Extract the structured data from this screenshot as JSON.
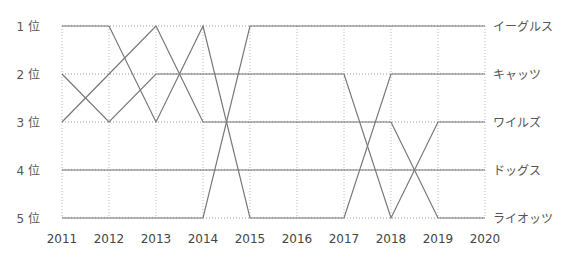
{
  "chart_data": {
    "type": "line",
    "title": "",
    "xlabel": "",
    "ylabel": "",
    "x": [
      "2011",
      "2012",
      "2013",
      "2014",
      "2015",
      "2016",
      "2017",
      "2018",
      "2019",
      "2020"
    ],
    "y_tick_labels": [
      "1 位",
      "2 位",
      "3 位",
      "4 位",
      "5 位"
    ],
    "ylim": [
      1,
      5
    ],
    "y_inverted": true,
    "grid": true,
    "legend_position": "right (end-of-line labels)",
    "series": [
      {
        "name": "イーグルス",
        "values": [
          5,
          5,
          5,
          5,
          1,
          1,
          1,
          1,
          1,
          1
        ]
      },
      {
        "name": "キャッツ",
        "values": [
          1,
          1,
          3,
          1,
          5,
          5,
          5,
          2,
          2,
          2
        ]
      },
      {
        "name": "ワイルズ",
        "values": [
          2,
          3,
          2,
          2,
          2,
          2,
          2,
          5,
          3,
          3
        ]
      },
      {
        "name": "ドッグス",
        "values": [
          4,
          4,
          4,
          4,
          4,
          4,
          4,
          4,
          4,
          4
        ]
      },
      {
        "name": "ライオッツ",
        "values": [
          3,
          2,
          1,
          3,
          3,
          3,
          3,
          3,
          5,
          5
        ]
      }
    ],
    "line_color": "#777777"
  }
}
